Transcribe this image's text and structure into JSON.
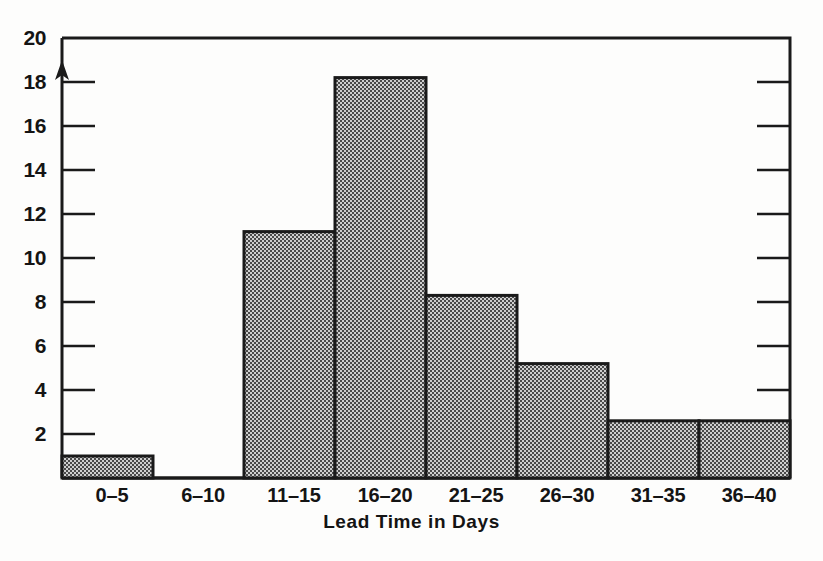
{
  "chart_data": {
    "type": "bar",
    "title": "",
    "subtitle": "",
    "xlabel": "Lead Time in Days",
    "ylabel": "",
    "categories": [
      "0–5",
      "6–10",
      "11–15",
      "16–20",
      "21–25",
      "26–30",
      "31–35",
      "36–40"
    ],
    "values": [
      1.0,
      0,
      11.2,
      18.2,
      8.3,
      5.2,
      2.6,
      2.6
    ],
    "ylim": [
      0,
      20
    ],
    "y_ticks": [
      2,
      4,
      6,
      8,
      10,
      12,
      14,
      16,
      18,
      20
    ],
    "y_tick_labels": [
      "2",
      "4",
      "6",
      "8",
      "10",
      "12",
      "14",
      "16",
      "18",
      "20"
    ],
    "grid": false,
    "legend": null,
    "legend_position": "none"
  },
  "figure": {
    "axis_title": "Lead Time in Days",
    "y_axis": {
      "labels": [
        "20",
        "18",
        "16",
        "14",
        "12",
        "10",
        "8",
        "6",
        "4",
        "2"
      ],
      "max_label": "20",
      "min_value_label": "2"
    },
    "x_axis": {
      "labels": [
        "0–5",
        "6–10",
        "11–15",
        "16–20",
        "21–25",
        "26–30",
        "31–35",
        "36–40"
      ]
    },
    "colors": {
      "ink": "#141414",
      "bar_fill": "#a9a9a9",
      "bar_outline": "#1a1a1a",
      "background": "#fdfdfc"
    }
  }
}
